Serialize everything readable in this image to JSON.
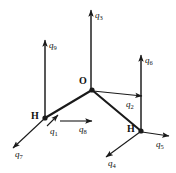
{
  "figure": {
    "background_color": "#ffffff",
    "stroke_color": "#1a1a1a",
    "atoms": [
      {
        "id": "atom-o",
        "label": "O",
        "x": 92,
        "y": 90,
        "label_x": 79,
        "label_y": 76
      },
      {
        "id": "atom-h1",
        "label": "H",
        "x": 45,
        "y": 118,
        "label_x": 31,
        "label_y": 111
      },
      {
        "id": "atom-h2",
        "label": "H",
        "x": 141,
        "y": 131,
        "label_x": 127,
        "label_y": 124
      }
    ],
    "bonds": [
      {
        "id": "bond-o-h1",
        "from": "atom-o",
        "to": "atom-h1"
      },
      {
        "id": "bond-o-h2",
        "from": "atom-o",
        "to": "atom-h2"
      }
    ],
    "guide_lines": [
      {
        "id": "guide-q9-stem",
        "x1": 45,
        "y1": 118,
        "x2": 45,
        "y2": 46
      },
      {
        "id": "guide-q6-stem",
        "x1": 141,
        "y1": 131,
        "x2": 141,
        "y2": 61
      },
      {
        "id": "guide-q3-stem",
        "x1": 91,
        "y1": 90,
        "x2": 91,
        "y2": 16
      }
    ],
    "vectors": [
      {
        "id": "vector-q1",
        "label": "q",
        "sub": "1",
        "x1": 47,
        "y1": 126,
        "x2": 58,
        "y2": 115,
        "label_x": 50,
        "label_y": 127
      },
      {
        "id": "vector-q2",
        "label": "q",
        "sub": "2",
        "x1": 93,
        "y1": 91,
        "x2": 142,
        "y2": 96,
        "label_x": 126,
        "label_y": 100
      },
      {
        "id": "vector-q3",
        "label": "q",
        "sub": "3",
        "x1": 91,
        "y1": 90,
        "x2": 91,
        "y2": 10,
        "label_x": 95,
        "label_y": 11
      },
      {
        "id": "vector-q4",
        "label": "q",
        "sub": "4",
        "x1": 140,
        "y1": 132,
        "x2": 106,
        "y2": 157,
        "label_x": 108,
        "label_y": 159
      },
      {
        "id": "vector-q5",
        "label": "q",
        "sub": "5",
        "x1": 142,
        "y1": 132,
        "x2": 169,
        "y2": 136,
        "label_x": 156,
        "label_y": 140
      },
      {
        "id": "vector-q6",
        "label": "q",
        "sub": "6",
        "x1": 141,
        "y1": 131,
        "x2": 141,
        "y2": 55,
        "label_x": 145,
        "label_y": 56
      },
      {
        "id": "vector-q7",
        "label": "q",
        "sub": "7",
        "x1": 44,
        "y1": 119,
        "x2": 13,
        "y2": 148,
        "label_x": 15,
        "label_y": 150
      },
      {
        "id": "vector-q8",
        "label": "q",
        "sub": "8",
        "x1": 60,
        "y1": 121,
        "x2": 92,
        "y2": 121,
        "label_x": 79,
        "label_y": 125
      },
      {
        "id": "vector-q9",
        "label": "q",
        "sub": "9",
        "x1": 45,
        "y1": 118,
        "x2": 45,
        "y2": 40,
        "label_x": 49,
        "label_y": 41
      }
    ]
  }
}
